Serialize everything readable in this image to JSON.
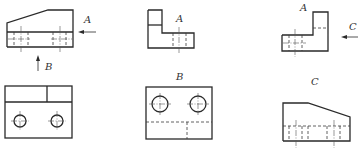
{
  "diagram": {
    "type": "orthographic-projection-exercise",
    "views": [
      {
        "id": "front-view-top-left",
        "position": "top-left"
      },
      {
        "id": "view-a-top-middle",
        "position": "top-middle",
        "label": "A"
      },
      {
        "id": "view-a-top-right",
        "position": "top-right",
        "label": "A"
      },
      {
        "id": "view-bottom-left",
        "position": "bottom-left"
      },
      {
        "id": "view-b-bottom-middle",
        "position": "bottom-middle",
        "label": "B"
      },
      {
        "id": "view-c-bottom-right",
        "position": "bottom-right",
        "label": "C"
      }
    ],
    "labels": {
      "arrow_a": "A",
      "arrow_b": "B",
      "arrow_c": "C",
      "view_a_middle": "A",
      "view_a_right": "A",
      "view_b": "B",
      "view_c": "C"
    },
    "colors": {
      "line": "#2a2a2a",
      "background": "#ffffff"
    }
  }
}
